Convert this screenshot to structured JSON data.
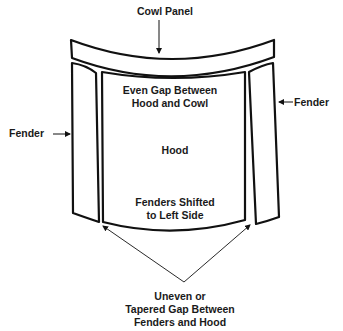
{
  "diagram": {
    "labels": {
      "cowl_panel": "Cowl Panel",
      "fender_left": "Fender",
      "fender_right": "Fender",
      "even_gap_line1": "Even Gap Between",
      "even_gap_line2": "Hood and Cowl",
      "hood": "Hood",
      "shifted_line1": "Fenders Shifted",
      "shifted_line2": "to Left Side",
      "uneven_line1": "Uneven or",
      "uneven_line2": "Tapered Gap Between",
      "uneven_line3": "Fenders and Hood"
    },
    "colors": {
      "stroke": "#111111",
      "text": "#1a1a1a",
      "background": "#ffffff"
    }
  }
}
